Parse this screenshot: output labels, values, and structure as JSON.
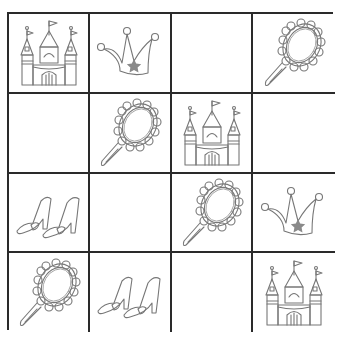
{
  "puzzle": {
    "type": "picture-sudoku-4x4",
    "rows": 4,
    "cols": 4,
    "grid": [
      [
        "castle",
        "crown",
        "",
        "mirror"
      ],
      [
        "",
        "mirror",
        "castle",
        ""
      ],
      [
        "shoes",
        "",
        "mirror",
        "crown"
      ],
      [
        "mirror",
        "shoes",
        "",
        "castle"
      ]
    ],
    "symbols": [
      "castle",
      "crown",
      "mirror",
      "shoes"
    ]
  },
  "colors": {
    "grid_line": "#2a2a2a",
    "outline": "#777777",
    "star": "#8a8a8a",
    "background": "#ffffff"
  }
}
